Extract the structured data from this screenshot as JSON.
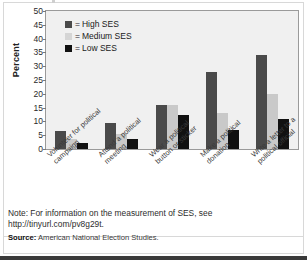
{
  "chart_data": {
    "type": "bar",
    "title": "",
    "xlabel": "",
    "ylabel": "Percent",
    "ylim": [
      0,
      50
    ],
    "yticks": [
      "0",
      "5",
      "10",
      "15",
      "20",
      "25",
      "30",
      "35",
      "40",
      "45",
      "50"
    ],
    "grid": false,
    "legend_position": "top-left",
    "categories": [
      "Volunteer for political campaign",
      "Attend a political meeting",
      "Wear a political button or sticker",
      "Make a political donation",
      "Write a letter to a political official"
    ],
    "series": [
      {
        "name": "High SES",
        "color": "#4a4a4a",
        "values": [
          6.5,
          9.5,
          16.0,
          28.0,
          34.0
        ]
      },
      {
        "name": "Medium SES",
        "color": "#c9c9c9",
        "values": [
          3.5,
          5.5,
          16.0,
          13.0,
          20.0
        ]
      },
      {
        "name": "Low SES",
        "color": "#111111",
        "values": [
          2.0,
          3.8,
          12.5,
          7.0,
          11.0
        ]
      }
    ]
  },
  "legend": {
    "equals": "=",
    "items": [
      {
        "label": "High SES"
      },
      {
        "label": "Medium SES"
      },
      {
        "label": "Low SES"
      }
    ]
  },
  "footer": {
    "note": "Note: For information on the measurement of SES, see http://tinyurl.com/pv8g29t.",
    "source_label": "Source:",
    "source_text": "American National Election Studies."
  }
}
